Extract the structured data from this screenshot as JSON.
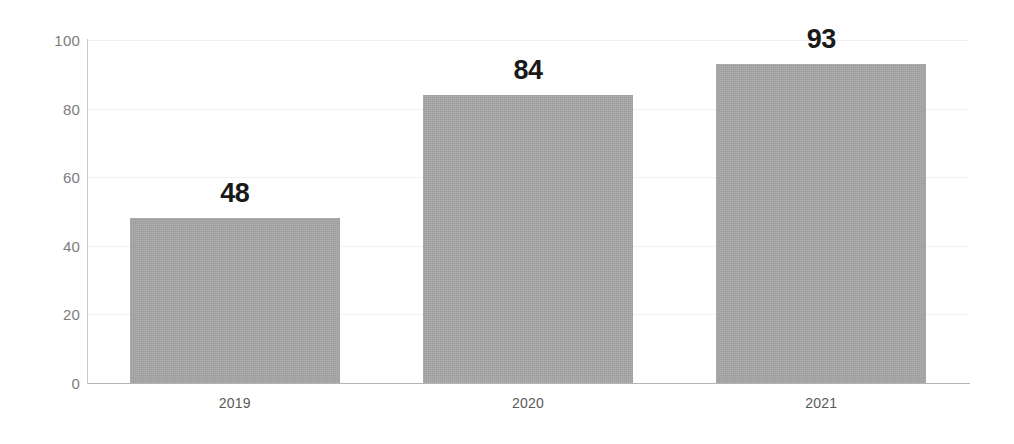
{
  "chart_data": {
    "type": "bar",
    "title": "",
    "subtitle": "",
    "xlabel": "",
    "ylabel": "",
    "categories": [
      "2019",
      "2020",
      "2021"
    ],
    "values": [
      48,
      84,
      93
    ],
    "data_labels": [
      "48",
      "84",
      "93"
    ],
    "ylim": [
      0,
      100
    ],
    "yticks": [
      0,
      20,
      40,
      60,
      80,
      100
    ],
    "ytick_labels": [
      "0",
      "20",
      "40",
      "60",
      "80",
      "100"
    ],
    "grid": "horizontal",
    "legend": "none",
    "bar_color": "#a8a8a8",
    "label_color": "#1a1a1a",
    "tick_color": "#7d7d7d",
    "gridline_color": "#f0f0f0",
    "axis_color": "#b4b4b4",
    "background": "#ffffff"
  }
}
